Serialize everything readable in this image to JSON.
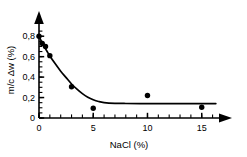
{
  "chart_data": {
    "type": "line",
    "title": "",
    "subtitle": "",
    "xlabel": "NaCl  (%)",
    "ylabel": "m/c  Δw  (%)",
    "xlim": [
      0,
      16.5
    ],
    "ylim": [
      0,
      0.9
    ],
    "grid": false,
    "legend": null,
    "x_ticks_major": [
      0,
      5,
      10,
      15
    ],
    "x_tick_labels": [
      "0",
      "5",
      "10",
      "15"
    ],
    "x_ticks_minor_step": 1,
    "y_ticks_major": [
      0,
      0.2,
      0.4,
      0.6,
      0.8
    ],
    "y_tick_labels": [
      "0",
      "0,2",
      "0,4",
      "0,6",
      "0,8"
    ],
    "y_ticks_minor_step": 0.05,
    "axis_arrows": {
      "x": "right",
      "y": "up"
    },
    "series": [
      {
        "name": "measured",
        "kind": "scatter",
        "marker": "filled-circle",
        "color": "#000000",
        "x": [
          0,
          0.3,
          0.6,
          1,
          3,
          5,
          10,
          15
        ],
        "y": [
          0.8,
          0.73,
          0.7,
          0.61,
          0.305,
          0.095,
          0.22,
          0.105
        ]
      },
      {
        "name": "fitted decay curve",
        "kind": "line",
        "color": "#000000",
        "x": [
          0,
          0.25,
          0.5,
          0.75,
          1,
          1.5,
          2,
          2.5,
          3,
          3.5,
          4,
          4.5,
          5,
          5.5,
          6,
          7,
          8,
          10,
          12,
          14,
          16.3
        ],
        "y": [
          0.8,
          0.745,
          0.695,
          0.65,
          0.607,
          0.53,
          0.458,
          0.395,
          0.333,
          0.282,
          0.238,
          0.203,
          0.178,
          0.161,
          0.151,
          0.144,
          0.142,
          0.141,
          0.141,
          0.141,
          0.141
        ]
      }
    ],
    "plateau_value": 0.14,
    "initial_value": 0.8
  },
  "axes": {
    "x_axis_name": "NaCl concentration axis",
    "y_axis_name": "moisture change axis"
  }
}
